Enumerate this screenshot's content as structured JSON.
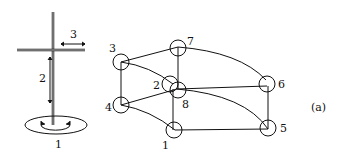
{
  "figure": {
    "caption": "(a)",
    "left_device": {
      "labels": [
        {
          "id": "1",
          "text": "1",
          "meaning": "base rotation"
        },
        {
          "id": "2",
          "text": "2",
          "meaning": "vertical travel"
        },
        {
          "id": "3",
          "text": "3",
          "meaning": "horizontal reach"
        }
      ]
    },
    "workspace": {
      "nodes": [
        {
          "id": "1",
          "text": "1"
        },
        {
          "id": "2",
          "text": "2"
        },
        {
          "id": "3",
          "text": "3"
        },
        {
          "id": "4",
          "text": "4"
        },
        {
          "id": "5",
          "text": "5"
        },
        {
          "id": "6",
          "text": "6"
        },
        {
          "id": "7",
          "text": "7"
        },
        {
          "id": "8",
          "text": "8"
        }
      ]
    }
  }
}
